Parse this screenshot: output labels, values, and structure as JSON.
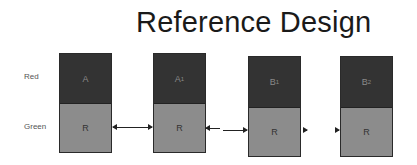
{
  "title": "Reference Design",
  "row_labels": {
    "top": "Red",
    "bottom": "Green"
  },
  "blocks": [
    {
      "top_label": "A",
      "top_sub": "",
      "bottom_label": "R"
    },
    {
      "top_label": "A",
      "top_sub": "1",
      "bottom_label": "R"
    },
    {
      "top_label": "B",
      "top_sub": "1",
      "bottom_label": "R"
    },
    {
      "top_label": "B",
      "top_sub": "2",
      "bottom_label": "R"
    }
  ],
  "connections": [
    {
      "from": 0,
      "to": 1,
      "type": "bidirectional"
    },
    {
      "from": 1,
      "to": 2,
      "type": "bidirectional-broken"
    },
    {
      "from": 2,
      "to": 3,
      "type": "bidirectional-short"
    }
  ],
  "colors": {
    "top_cell": "#333333",
    "bottom_cell": "#8c8c8c",
    "arrow": "#222222"
  }
}
